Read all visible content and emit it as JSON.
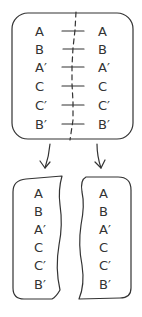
{
  "diagram": {
    "type": "split-sequence-diagram",
    "top_box": {
      "left_column": [
        "A",
        "B",
        "A′",
        "C",
        "C′",
        "B′"
      ],
      "right_column": [
        "A",
        "B",
        "A′",
        "C",
        "C′",
        "B′"
      ],
      "divider": "dashed-vertical-cut-line"
    },
    "arrows": [
      "left-down-arrow",
      "right-down-arrow"
    ],
    "bottom_left_box": {
      "items": [
        "A",
        "B",
        "A′",
        "C",
        "C′",
        "B′"
      ]
    },
    "bottom_right_box": {
      "items": [
        "A",
        "B",
        "A′",
        "C",
        "C′",
        "B′"
      ]
    },
    "colors": {
      "ink": "#333333",
      "background": "#ffffff"
    }
  }
}
